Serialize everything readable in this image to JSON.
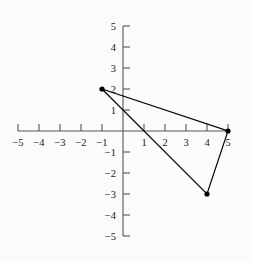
{
  "figure": {
    "kind": "cartesian-coordinate-plane",
    "background_color": "#fbfbfb",
    "axis_color": "#555555",
    "shape_color": "#000000",
    "point_color": "#000000"
  },
  "chart_data": {
    "type": "scatter",
    "title": "",
    "subtitle": "",
    "xlabel": "",
    "ylabel": "",
    "xlim": [
      -5,
      5
    ],
    "ylim": [
      -5,
      5
    ],
    "grid": false,
    "legend": false,
    "x_ticks": [
      -5,
      -4,
      -3,
      -2,
      -1,
      1,
      2,
      3,
      4,
      5
    ],
    "y_ticks": [
      5,
      4,
      3,
      2,
      1,
      -1,
      -2,
      -3,
      -4,
      -5
    ],
    "x_tick_labels": [
      "−5",
      "−4",
      "−3",
      "−2",
      "−1",
      "1",
      "2",
      "3",
      "4",
      "5"
    ],
    "y_tick_labels": [
      "5",
      "4",
      "3",
      "2",
      "1",
      "−1",
      "−2",
      "−3",
      "−4",
      "−5"
    ],
    "origin_label": "",
    "series": [
      {
        "name": "triangle",
        "shape": "polygon",
        "closed": true,
        "points": [
          {
            "x": -1,
            "y": 2
          },
          {
            "x": 5,
            "y": 0
          },
          {
            "x": 4,
            "y": -3
          }
        ],
        "vertex_labels": [
          "(-1, 2)",
          "(5, 0)",
          "(4, -3)"
        ],
        "marker": "filled-circle",
        "marker_size": 4,
        "line_width": 1.2
      }
    ]
  }
}
